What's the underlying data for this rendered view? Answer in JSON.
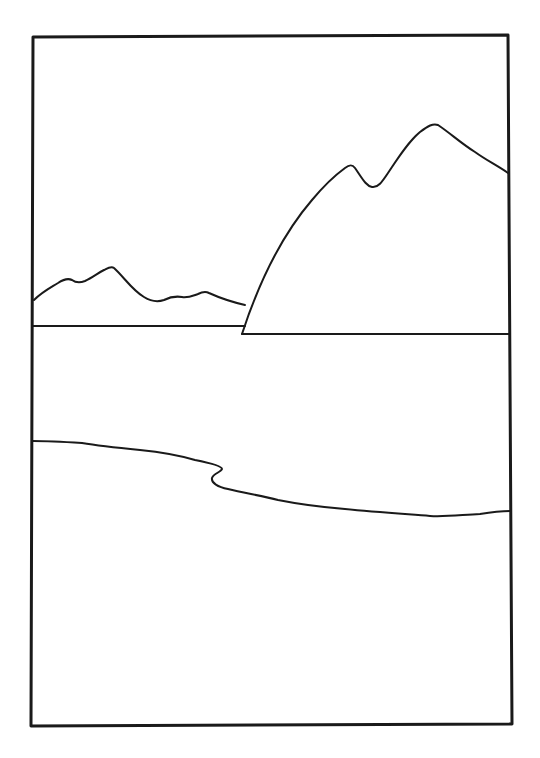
{
  "illustration": {
    "subject": "line-art landscape: distant hills, large mountain, lake, shoreline",
    "colors": {
      "ink": "#1a1a1a",
      "paper": "#ffffff"
    },
    "frame": {
      "x1": 33,
      "y1": 36,
      "x2": 509,
      "y2": 725
    }
  }
}
